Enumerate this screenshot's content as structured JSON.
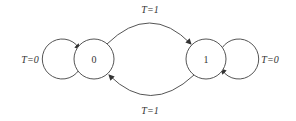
{
  "diagram": {
    "type": "state-transition",
    "states": [
      {
        "id": "s0",
        "label": "0"
      },
      {
        "id": "s1",
        "label": "1"
      }
    ],
    "transitions": [
      {
        "from": "s0",
        "to": "s0",
        "label": "T=0"
      },
      {
        "from": "s0",
        "to": "s1",
        "label": "T=1"
      },
      {
        "from": "s1",
        "to": "s0",
        "label": "T=1"
      },
      {
        "from": "s1",
        "to": "s1",
        "label": "T=0"
      }
    ],
    "colors": {
      "stroke": "#555555",
      "text": "#333333",
      "background": "#ffffff"
    }
  }
}
